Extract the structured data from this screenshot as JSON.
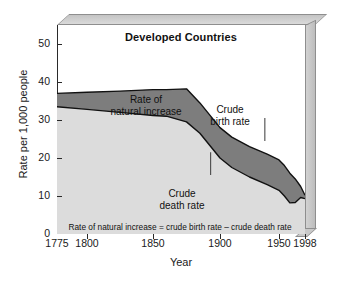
{
  "chart_data": {
    "type": "area",
    "title": "Developed Countries",
    "xlabel": "Year",
    "ylabel": "Rate per 1,000 people",
    "xtick_labels": [
      "1775",
      "1800",
      "1850",
      "1900",
      "1950",
      "1998"
    ],
    "xtick_values": [
      1775,
      1800,
      1850,
      1900,
      1950,
      1998
    ],
    "ytick_labels": [
      "0",
      "10",
      "20",
      "30",
      "40",
      "50"
    ],
    "ytick_values": [
      0,
      10,
      20,
      30,
      40,
      50
    ],
    "ylim": [
      0,
      55
    ],
    "grid": false,
    "legend": "none",
    "x": [
      1775,
      1800,
      1825,
      1850,
      1860,
      1875,
      1885,
      1900,
      1910,
      1925,
      1940,
      1950,
      1960,
      1970,
      1980,
      1990,
      1998
    ],
    "series": [
      {
        "name": "Crude birth rate",
        "values": [
          37.0,
          37.3,
          37.6,
          38.0,
          38.0,
          38.2,
          34.5,
          28.0,
          25.5,
          23.0,
          21.0,
          19.5,
          18.0,
          16.0,
          14.5,
          12.5,
          10.2
        ],
        "color": "#111111",
        "role": "upper-bound"
      },
      {
        "name": "Crude death rate",
        "values": [
          33.5,
          32.8,
          32.0,
          31.2,
          31.0,
          29.5,
          26.5,
          20.0,
          17.5,
          15.0,
          13.0,
          11.5,
          10.0,
          8.2,
          8.3,
          9.6,
          9.3
        ],
        "color": "#111111",
        "role": "lower-bound"
      }
    ],
    "bands": [
      {
        "name": "Rate of natural increase",
        "between": [
          "Crude birth rate",
          "Crude death rate"
        ],
        "color": "#7d7d7d"
      },
      {
        "name": "Area below crude death rate",
        "color": "#dcdcdc"
      }
    ],
    "annotations": [
      {
        "name": "rate-of-natural-increase",
        "line1": "Rate of",
        "line2": "natural increase",
        "leader": false
      },
      {
        "name": "crude-birth-rate",
        "line1": "Crude",
        "line2": "birth rate",
        "leader": true
      },
      {
        "name": "crude-death-rate",
        "line1": "Crude",
        "line2": "death rate",
        "leader": true
      }
    ],
    "footnote": "Rate of natural increase = crude birth rate – crude death rate"
  },
  "colors": {
    "natural_increase_band": "#7d7d7d",
    "below_death_rate": "#dcdcdc",
    "plot_background": "#ffffff",
    "frame": "#c9c9c9",
    "frame_edge": "#8e8e8e",
    "axis": "#2a2a2a",
    "text": "#111111"
  },
  "axes": {
    "y_title": "Rate per 1,000 people",
    "x_title": "Year"
  }
}
